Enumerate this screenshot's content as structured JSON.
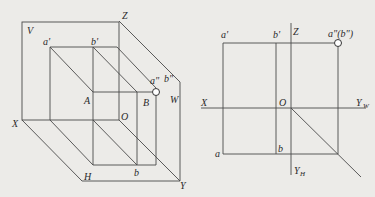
{
  "left_diagram": {
    "title": "Three-plane projection system (pictorial)",
    "labels": {
      "V": "V",
      "Z": "Z",
      "a_prime": "a'",
      "b_prime": "b'",
      "a_dprime": "a\"",
      "b_dprime": "b\"",
      "W": "W",
      "A": "A",
      "B": "B",
      "O": "O",
      "X": "X",
      "H": "H",
      "b": "b",
      "Y": "Y"
    }
  },
  "right_diagram": {
    "title": "Three-view projection (orthographic)",
    "labels": {
      "a_prime": "a'",
      "b_prime": "b'",
      "Z": "Z",
      "a_dprime_b_dprime": "a\"(b\")",
      "X": "X",
      "O": "O",
      "Y_W": "Y",
      "Y_W_sub": "W",
      "a": "a",
      "b": "b",
      "Y_H": "Y",
      "Y_H_sub": "H"
    }
  },
  "colors": {
    "background": "#ecebe8",
    "line": "#4a4a4a",
    "text": "#2a2a2a"
  }
}
